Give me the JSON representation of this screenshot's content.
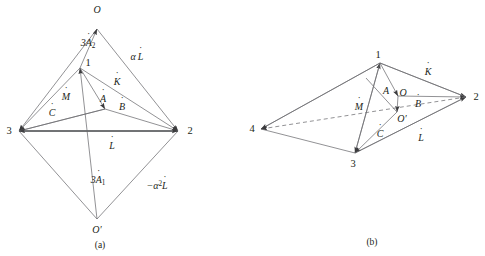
{
  "figure": {
    "width": 485,
    "height": 256,
    "background": "#ffffff",
    "stroke_color": "#58595b",
    "text_color": "#231f20"
  },
  "panels": [
    {
      "id": "panel-a",
      "caption": "(a)",
      "caption_pos": {
        "x": 100,
        "y": 246
      },
      "vertices": [
        {
          "name": "O",
          "label": "O",
          "x": 97,
          "y": 29,
          "label_x": 97,
          "label_y": 10
        },
        {
          "name": "1",
          "label": "1",
          "x": 80,
          "y": 68,
          "label_x": 88,
          "label_y": 63
        },
        {
          "name": "3",
          "label": "3",
          "x": 19,
          "y": 131,
          "label_x": 9,
          "label_y": 131
        },
        {
          "name": "2",
          "label": "2",
          "x": 178,
          "y": 131,
          "label_x": 190,
          "label_y": 131
        },
        {
          "name": "Op",
          "label": "O′",
          "x": 97,
          "y": 219,
          "label_x": 97,
          "label_y": 230
        },
        {
          "name": "c",
          "label": "",
          "x": 105,
          "y": 109,
          "label_x": 105,
          "label_y": 109
        }
      ],
      "edge_labels": [
        {
          "name": "edge-label-3A2",
          "base": "3A",
          "dot_on": "A",
          "sub": "2",
          "sup": "",
          "prefix": "",
          "x": 88,
          "y": 44,
          "italic": true
        },
        {
          "name": "edge-label-alphaL",
          "base": "α L",
          "dot_on": "L",
          "sub": "",
          "sup": "",
          "prefix": "",
          "x": 137,
          "y": 57,
          "italic": true
        },
        {
          "name": "edge-label-K",
          "base": "K",
          "dot_on": "K",
          "sub": "",
          "sup": "",
          "prefix": "",
          "x": 117,
          "y": 82,
          "italic": true
        },
        {
          "name": "edge-label-M",
          "base": "M",
          "dot_on": "M",
          "sub": "",
          "sup": "",
          "prefix": "",
          "x": 66,
          "y": 97,
          "italic": true
        },
        {
          "name": "edge-label-A",
          "base": "A",
          "dot_on": "A",
          "sub": "",
          "sup": "",
          "prefix": "",
          "x": 103,
          "y": 99,
          "italic": true
        },
        {
          "name": "edge-label-B",
          "base": "B",
          "dot_on": "B",
          "sub": "",
          "sup": "",
          "prefix": "",
          "x": 122,
          "y": 107,
          "italic": true
        },
        {
          "name": "edge-label-C",
          "base": "C",
          "dot_on": "C",
          "sub": "",
          "sup": "",
          "prefix": "",
          "x": 52,
          "y": 113,
          "italic": true
        },
        {
          "name": "edge-label-L",
          "base": "L",
          "dot_on": "L",
          "sub": "",
          "sup": "",
          "prefix": "",
          "x": 112,
          "y": 146,
          "italic": true
        },
        {
          "name": "edge-label-3A1",
          "base": "3A",
          "dot_on": "A",
          "sub": "1",
          "sup": "",
          "prefix": "",
          "x": 98,
          "y": 181,
          "italic": true
        },
        {
          "name": "edge-label-neg-a2L",
          "base": "L",
          "dot_on": "L",
          "sub": "",
          "sup": "2",
          "prefix": "−α",
          "x": 157,
          "y": 186,
          "italic": true
        }
      ]
    },
    {
      "id": "panel-b",
      "caption": "(b)",
      "caption_pos": {
        "x": 372,
        "y": 243
      },
      "vertices": [
        {
          "name": "1",
          "label": "1",
          "x": 380,
          "y": 63,
          "label_x": 378,
          "label_y": 55
        },
        {
          "name": "2",
          "label": "2",
          "x": 466,
          "y": 97,
          "label_x": 476,
          "label_y": 97
        },
        {
          "name": "3",
          "label": "3",
          "x": 355,
          "y": 153,
          "label_x": 353,
          "label_y": 164
        },
        {
          "name": "4",
          "label": "4",
          "x": 261,
          "y": 129,
          "label_x": 252,
          "label_y": 129
        },
        {
          "name": "O",
          "label": "O",
          "x": 398,
          "y": 96,
          "label_x": 399,
          "label_y": 95
        },
        {
          "name": "Op",
          "label": "O′",
          "x": 397,
          "y": 112,
          "label_x": 400,
          "label_y": 117
        }
      ],
      "edge_labels": [
        {
          "name": "edge-label-K",
          "base": "K",
          "dot_on": "K",
          "sub": "",
          "sup": "",
          "prefix": "",
          "x": 428,
          "y": 72,
          "italic": true
        },
        {
          "name": "edge-label-A",
          "base": "A",
          "dot_on": "",
          "sub": "",
          "sup": "",
          "prefix": "",
          "x": 386,
          "y": 91,
          "italic": true
        },
        {
          "name": "edge-label-B",
          "base": "B",
          "dot_on": "B",
          "sub": "",
          "sup": "",
          "prefix": "",
          "x": 416,
          "y": 104,
          "italic": true
        },
        {
          "name": "edge-label-M",
          "base": "M",
          "dot_on": "M",
          "sub": "",
          "sup": "",
          "prefix": "",
          "x": 359,
          "y": 107,
          "italic": true
        },
        {
          "name": "edge-label-C",
          "base": "C",
          "dot_on": "C",
          "sub": "",
          "sup": "",
          "prefix": "",
          "x": 380,
          "y": 134,
          "italic": true
        },
        {
          "name": "edge-label-L",
          "base": "L",
          "dot_on": "L",
          "sub": "",
          "sup": "",
          "prefix": "",
          "x": 421,
          "y": 138,
          "italic": true
        }
      ]
    }
  ]
}
